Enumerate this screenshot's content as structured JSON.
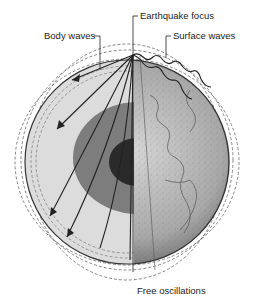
{
  "diagram": {
    "type": "cross-section",
    "labels": {
      "earthquake_focus": "Earthquake focus",
      "body_waves": "Body waves",
      "surface_waves": "Surface waves",
      "free_oscillations": "Free oscillations"
    },
    "layers": [
      {
        "name": "crust-mantle",
        "color": "#d8d8d8"
      },
      {
        "name": "outer-core",
        "color": "#7a7a7a"
      },
      {
        "name": "inner-core",
        "color": "#2a2a2a"
      }
    ],
    "colors": {
      "ink": "#222222",
      "globe_surface": "#b8b8b8",
      "dashed_outline": "#666666"
    }
  }
}
